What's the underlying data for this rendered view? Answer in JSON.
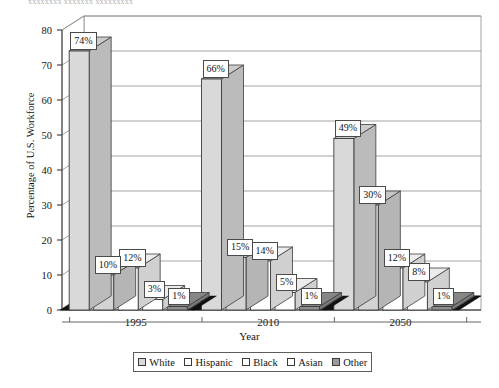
{
  "figure": {
    "caption_top": "xxxxxxxx xxxxxxx xxxxxxxxx",
    "xlabel": "Year",
    "ylabel": "Percentage of U.S. Workforce"
  },
  "legend": {
    "items": [
      {
        "label": "White",
        "swatch": "#d9d9d9"
      },
      {
        "label": "Hispanic",
        "swatch": "#ffffff"
      },
      {
        "label": "Black",
        "swatch": "#ffffff"
      },
      {
        "label": "Asian",
        "swatch": "#ffffff"
      },
      {
        "label": "Other",
        "swatch": "#9a9a9a"
      }
    ]
  },
  "axis": {
    "yticks": [
      "0",
      "10",
      "20",
      "30",
      "40",
      "50",
      "60",
      "70",
      "80"
    ],
    "xcats": [
      "1995",
      "2010",
      "2050"
    ]
  },
  "chart_data": {
    "type": "bar",
    "title": "",
    "xlabel": "Year",
    "ylabel": "Percentage of U.S. Workforce",
    "ylim": [
      0,
      80
    ],
    "ytick_step": 10,
    "grid": true,
    "legend_position": "bottom",
    "style": "3d-column",
    "categories": [
      "1995",
      "2010",
      "2050"
    ],
    "series": [
      {
        "name": "White",
        "values": [
          74,
          66,
          49
        ],
        "labels": [
          "74%",
          "66%",
          "49%"
        ],
        "fill": "#d9d9d9"
      },
      {
        "name": "Hispanic",
        "values": [
          10,
          15,
          30
        ],
        "labels": [
          "10%",
          "15%",
          "30%"
        ],
        "fill": "#d3d3d3"
      },
      {
        "name": "Black",
        "values": [
          12,
          14,
          12
        ],
        "labels": [
          "12%",
          "14%",
          "12%"
        ],
        "fill": "#ffffff"
      },
      {
        "name": "Asian",
        "values": [
          3,
          5,
          8
        ],
        "labels": [
          "3%",
          "5%",
          "8%"
        ],
        "fill": "#ffffff"
      },
      {
        "name": "Other",
        "values": [
          1,
          1,
          1
        ],
        "labels": [
          "1%",
          "1%",
          "1%"
        ],
        "fill": "#8f8f8f"
      }
    ]
  }
}
